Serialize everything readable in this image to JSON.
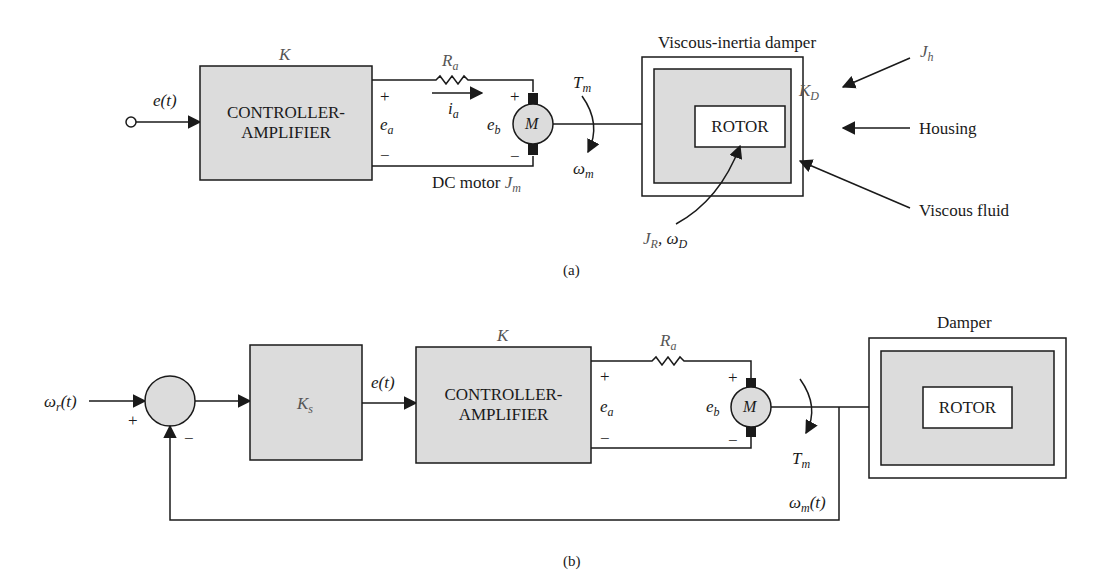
{
  "diagram_a": {
    "caption": "(a)",
    "input_signal": "e(t)",
    "controller": {
      "gain_label": "K",
      "line1": "CONTROLLER-",
      "line2": "AMPLIFIER"
    },
    "armature_resistor": {
      "symbol": "R",
      "subscript": "a"
    },
    "armature_current": {
      "symbol": "i",
      "subscript": "a"
    },
    "applied_voltage": {
      "symbol": "e",
      "subscript": "a",
      "plus": "+",
      "minus": "−"
    },
    "back_emf": {
      "symbol": "e",
      "subscript": "b",
      "plus": "+",
      "minus": "−"
    },
    "motor": {
      "symbol": "M",
      "label_prefix": "DC motor",
      "inertia_symbol": "J",
      "inertia_subscript": "m"
    },
    "torque": {
      "symbol": "T",
      "subscript": "m"
    },
    "speed": {
      "symbol": "ω",
      "subscript": "m"
    },
    "damper": {
      "title": "Viscous-inertia damper",
      "rotor_label": "ROTOR",
      "damping_constant": {
        "symbol": "K",
        "subscript": "D"
      },
      "housing_inertia": {
        "symbol": "J",
        "subscript": "h"
      },
      "rotor_params": {
        "symbol1": "J",
        "subscript1": "R",
        "symbol2": "ω",
        "subscript2": "D"
      },
      "callouts": {
        "housing": "Housing",
        "viscous_fluid": "Viscous fluid"
      }
    }
  },
  "diagram_b": {
    "caption": "(b)",
    "reference_input": {
      "symbol": "ω",
      "subscript": "r",
      "suffix": "(t)"
    },
    "summing_junction": {
      "plus": "+",
      "minus": "−"
    },
    "sensor_block": {
      "symbol": "K",
      "subscript": "s"
    },
    "error_signal": "e(t)",
    "controller": {
      "gain_label": "K",
      "line1": "CONTROLLER-",
      "line2": "AMPLIFIER"
    },
    "armature_resistor": {
      "symbol": "R",
      "subscript": "a"
    },
    "applied_voltage": {
      "symbol": "e",
      "subscript": "a",
      "plus": "+",
      "minus": "−"
    },
    "back_emf": {
      "symbol": "e",
      "subscript": "b",
      "plus": "+",
      "minus": "−"
    },
    "motor": {
      "symbol": "M"
    },
    "torque": {
      "symbol": "T",
      "subscript": "m"
    },
    "feedback_signal": {
      "symbol": "ω",
      "subscript": "m",
      "suffix": "(t)"
    },
    "damper": {
      "title": "Damper",
      "rotor_label": "ROTOR"
    }
  },
  "colors": {
    "block_fill": "#dcdcdc",
    "line": "#1a1a1a",
    "background": "#ffffff"
  }
}
